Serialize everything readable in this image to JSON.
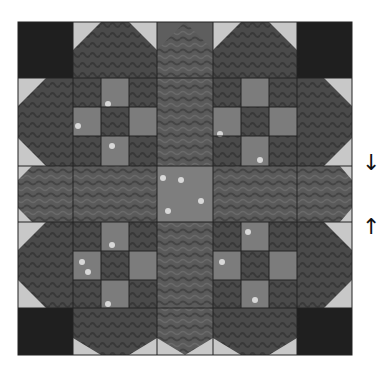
{
  "figure": {
    "colors": {
      "background": "#ffffff",
      "light": "#c8c8c8",
      "dark": "#1f1f1f",
      "medium_print": "#5c5c5c",
      "dark_print": "#474747",
      "light_print": "#7e7e7e",
      "seam": "#222222",
      "dot": "#d8d8d8"
    },
    "block": {
      "x": 18,
      "y": 22,
      "size": 334
    },
    "columns": [
      18,
      73,
      157,
      213,
      297,
      352
    ],
    "rows": [
      22,
      78,
      166,
      222,
      308,
      355
    ]
  },
  "annotations": {
    "arrow_down": "↓",
    "arrow_up": "↑"
  }
}
